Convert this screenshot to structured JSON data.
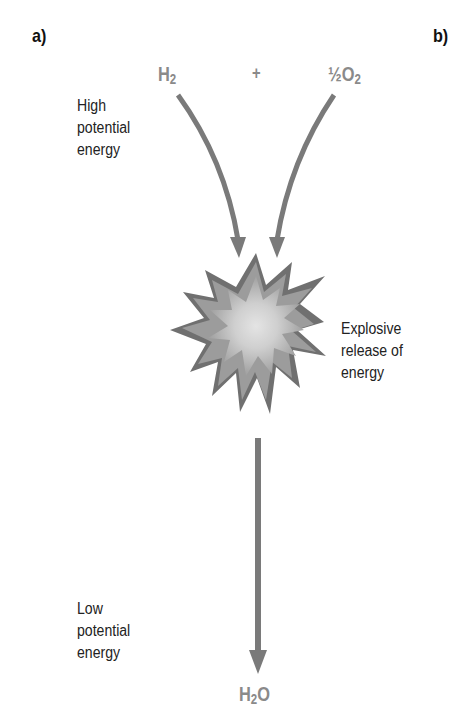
{
  "panels": {
    "a_label": "a)",
    "b_label": "b)"
  },
  "reactants": {
    "h2": {
      "symbol": "H",
      "subscript": "2"
    },
    "plus": "+",
    "o2": {
      "coefficient": "½",
      "symbol": "O",
      "subscript": "2"
    }
  },
  "product": {
    "h": "H",
    "subscript": "2",
    "o": "O"
  },
  "labels": {
    "high": [
      "High",
      "potential",
      "energy"
    ],
    "explosive": [
      "Explosive",
      "release of",
      "energy"
    ],
    "low": [
      "Low",
      "potential",
      "energy"
    ]
  },
  "colors": {
    "arrow": "#7a7a7a",
    "formula": "#8a8a8a",
    "burst_outer": "#6e6e6e",
    "burst_mid": "#9a9a9a",
    "burst_inner": "#d6d6d6"
  }
}
